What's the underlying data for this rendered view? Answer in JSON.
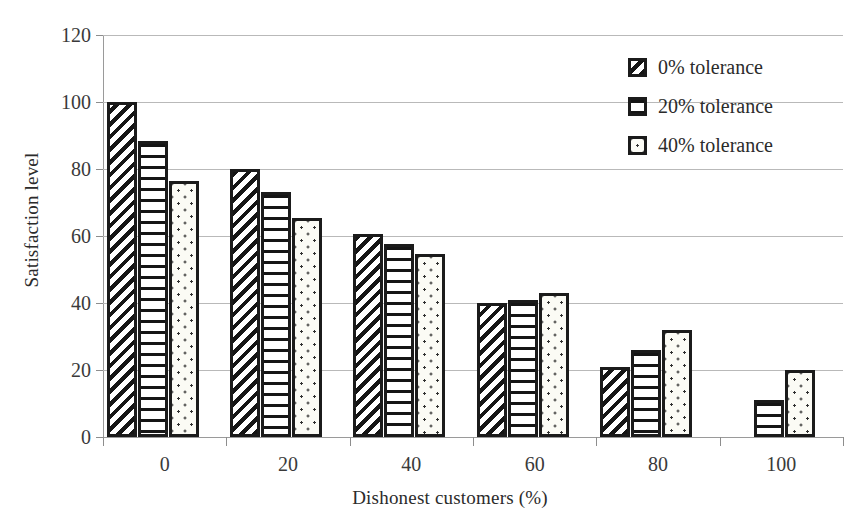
{
  "chart_data": {
    "type": "bar",
    "title": "",
    "xlabel": "Dishonest customers (%)",
    "ylabel": "Satisfaction level",
    "categories": [
      "0",
      "20",
      "40",
      "60",
      "80",
      "100"
    ],
    "series": [
      {
        "name": "0% tolerance",
        "pattern": "diagonal-hatch",
        "values": [
          100,
          80,
          60.5,
          40,
          21,
          0
        ]
      },
      {
        "name": "20% tolerance",
        "pattern": "horizontal-lines",
        "values": [
          88.5,
          73,
          57.5,
          41,
          26,
          11
        ]
      },
      {
        "name": "40% tolerance",
        "pattern": "dots",
        "values": [
          76.5,
          65.5,
          54.5,
          43,
          32,
          20
        ]
      }
    ],
    "ylim": [
      0,
      120
    ],
    "yticks": [
      0,
      20,
      40,
      60,
      80,
      100,
      120
    ],
    "ytick_labels": [
      "0",
      "20",
      "40",
      "60",
      "80",
      "100",
      "120"
    ],
    "xtick_labels": [
      "0",
      "20",
      "40",
      "60",
      "80",
      "100"
    ],
    "grid": true,
    "grid_axis": "y",
    "legend_position": "top-right",
    "legend": [
      "0% tolerance",
      "20% tolerance",
      "40% tolerance"
    ],
    "colors": {
      "bar_outline": "#1b1b1b",
      "bar_fill": "#ffffff",
      "gridline": "#b9b9b9",
      "axis": "#9a9a9a",
      "text": "#2b2b2b",
      "background": "#ffffff"
    }
  }
}
